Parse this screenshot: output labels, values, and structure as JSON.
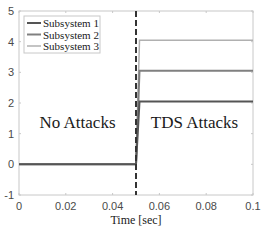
{
  "chart_data": {
    "type": "line",
    "title": "",
    "xlabel": "Time [sec]",
    "ylabel": "",
    "xlim": [
      0,
      0.1
    ],
    "ylim": [
      -1,
      5
    ],
    "xticks": [
      "0",
      "0.02",
      "0.04",
      "0.06",
      "0.08",
      "0.1"
    ],
    "yticks": [
      "-1",
      "0",
      "1",
      "2",
      "3",
      "4",
      "5"
    ],
    "grid": false,
    "legend_position": "upper-left",
    "series": [
      {
        "name": "Subsystem 1",
        "color": "#555555",
        "x": [
          0,
          0.05,
          0.0515,
          0.1
        ],
        "y": [
          0,
          0,
          2.05,
          2.05
        ]
      },
      {
        "name": "Subsystem 2",
        "color": "#808080",
        "x": [
          0,
          0.05,
          0.0515,
          0.1
        ],
        "y": [
          0,
          0,
          3.05,
          3.05
        ]
      },
      {
        "name": "Subsystem 3",
        "color": "#b0b0b0",
        "x": [
          0,
          0.05,
          0.0515,
          0.1
        ],
        "y": [
          0,
          0,
          4.05,
          4.05
        ]
      }
    ],
    "annotations": [
      {
        "text": "No Attacks",
        "x": 0.025,
        "y": 1.2
      },
      {
        "text": "TDS Attacks",
        "x": 0.075,
        "y": 1.2
      },
      {
        "type": "vline",
        "x": 0.05,
        "style": "dashed",
        "color": "#333333"
      }
    ]
  }
}
